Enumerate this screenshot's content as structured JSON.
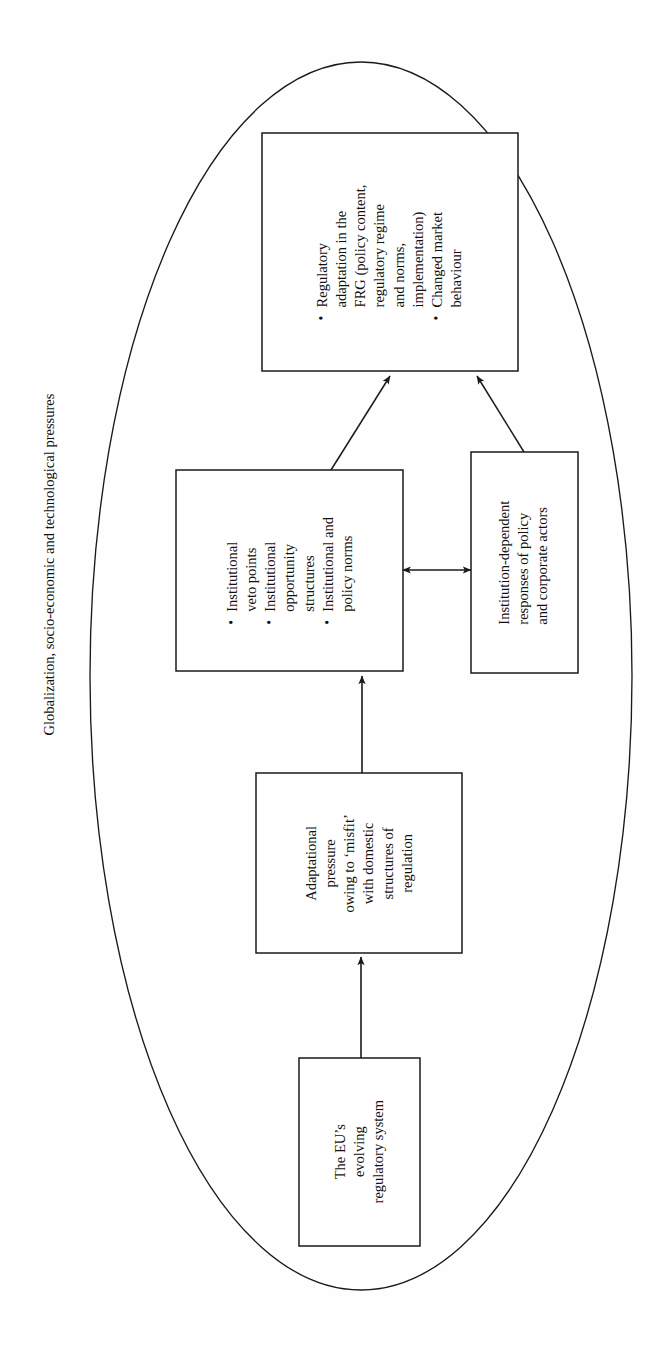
{
  "figure": {
    "type": "flow-diagram",
    "orientation": "rotated-90-counterclockwise",
    "outer_label": "Globalization, socio-economic and technological pressures",
    "outer_shape": "ellipse",
    "line_color": "#1a1a1a",
    "background_color": "#fefefe"
  },
  "nodes": {
    "outcome": {
      "id": "regulatory-adaptation",
      "kind": "bulleted-box",
      "bullets": [
        [
          "Regulatory",
          "adaptation in the",
          "FRG (policy content,",
          "regulatory regime",
          "and norms,",
          "implementation)"
        ],
        [
          "Changed market",
          "behaviour"
        ]
      ]
    },
    "institutions": {
      "id": "institutional-factors",
      "kind": "bulleted-box",
      "bullets": [
        [
          "Institutional",
          "veto points"
        ],
        [
          "Institutional",
          "opportunity",
          "structures"
        ],
        [
          "Institutional and",
          "policy norms"
        ]
      ]
    },
    "actors": {
      "id": "institution-dependent-responses",
      "kind": "plain-box",
      "lines": [
        "Institution-dependent",
        "responses of policy",
        "and corporate actors"
      ]
    },
    "pressure": {
      "id": "adaptational-pressure",
      "kind": "plain-box",
      "lines": [
        "Adaptational",
        "pressure",
        "owing to ‘misfit’",
        "with domestic",
        "structures of",
        "regulation"
      ]
    },
    "source": {
      "id": "eu-regulatory-system",
      "kind": "plain-box",
      "lines": [
        "The EU’s",
        "evolving",
        "regulatory system"
      ]
    }
  },
  "edges": [
    {
      "id": "edge-eu-to-pressure",
      "from": "eu-regulatory-system",
      "to": "adaptational-pressure",
      "style": "single-arrow"
    },
    {
      "id": "edge-pressure-to-institutions",
      "from": "adaptational-pressure",
      "to": "institutional-factors",
      "style": "single-arrow"
    },
    {
      "id": "edge-institutions-to-actors",
      "from": "institutional-factors",
      "to": "institution-dependent-responses",
      "style": "double-arrow"
    },
    {
      "id": "edge-institutions-to-outcome",
      "from": "institutional-factors",
      "to": "regulatory-adaptation",
      "style": "single-arrow"
    },
    {
      "id": "edge-actors-to-outcome",
      "from": "institution-dependent-responses",
      "to": "regulatory-adaptation",
      "style": "single-arrow"
    }
  ]
}
